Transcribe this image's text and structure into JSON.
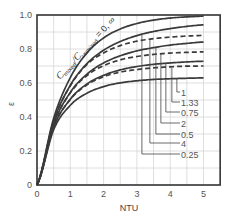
{
  "chart_data": {
    "type": "line",
    "title": "",
    "xlabel": "NTU",
    "ylabel": "ε",
    "xlim": [
      0,
      5.5
    ],
    "ylim": [
      0,
      1.0
    ],
    "grid": true,
    "grid_step_x": 0.5,
    "grid_step_y": 0.1,
    "x_ticks": [
      "0",
      "1",
      "2",
      "3",
      "4",
      "5"
    ],
    "y_ticks": [
      "0",
      "0.2",
      "0.4",
      "0.6",
      "0.8",
      "1.0"
    ],
    "annotation": {
      "prefix": "C",
      "sub1": "mixed",
      "slash": "/",
      "c2": "C",
      "sub2": "unmixed",
      "suffix": " = 0, ∞"
    },
    "x": [
      0,
      0.5,
      1,
      1.5,
      2,
      2.5,
      3,
      3.5,
      4,
      4.5,
      5
    ],
    "series": [
      {
        "name": "0, ∞",
        "style": "solid",
        "values": [
          0,
          0.393,
          0.632,
          0.777,
          0.865,
          0.918,
          0.95,
          0.97,
          0.982,
          0.989,
          0.993
        ]
      },
      {
        "name": "0.25",
        "style": "solid",
        "values": [
          0,
          0.375,
          0.587,
          0.714,
          0.793,
          0.844,
          0.879,
          0.903,
          0.92,
          0.933,
          0.942
        ]
      },
      {
        "name": "4",
        "style": "dashed",
        "values": [
          0,
          0.375,
          0.584,
          0.709,
          0.777,
          0.82,
          0.846,
          0.861,
          0.87,
          0.876,
          0.88
        ]
      },
      {
        "name": "0.5",
        "style": "solid",
        "values": [
          0,
          0.358,
          0.545,
          0.652,
          0.718,
          0.76,
          0.789,
          0.808,
          0.823,
          0.833,
          0.841
        ]
      },
      {
        "name": "2",
        "style": "dashed",
        "values": [
          0,
          0.357,
          0.542,
          0.644,
          0.702,
          0.736,
          0.756,
          0.768,
          0.776,
          0.78,
          0.783
        ]
      },
      {
        "name": "0.75",
        "style": "solid",
        "values": [
          0,
          0.341,
          0.505,
          0.594,
          0.645,
          0.677,
          0.697,
          0.71,
          0.718,
          0.724,
          0.728
        ]
      },
      {
        "name": "1.33",
        "style": "dashed",
        "values": [
          0,
          0.341,
          0.503,
          0.589,
          0.637,
          0.664,
          0.679,
          0.689,
          0.695,
          0.699,
          0.7
        ]
      },
      {
        "name": "1",
        "style": "solid",
        "values": [
          0,
          0.325,
          0.469,
          0.54,
          0.579,
          0.601,
          0.613,
          0.621,
          0.625,
          0.628,
          0.63
        ]
      }
    ],
    "legend": [
      {
        "label": "1",
        "series": "1",
        "leader_x": 4.2,
        "label_y_px": 92
      },
      {
        "label": "1.33",
        "series": "1.33",
        "leader_x": 4.05,
        "label_y_px": 102
      },
      {
        "label": "0.75",
        "series": "0.75",
        "leader_x": 3.87,
        "label_y_px": 112
      },
      {
        "label": "2",
        "series": "2",
        "leader_x": 3.72,
        "label_y_px": 123
      },
      {
        "label": "0.5",
        "series": "0.5",
        "leader_x": 3.57,
        "label_y_px": 134
      },
      {
        "label": "4",
        "series": "4",
        "leader_x": 3.39,
        "label_y_px": 143
      },
      {
        "label": "0.25",
        "series": "0.25",
        "leader_x": 3.15,
        "label_y_px": 154
      }
    ],
    "colors": {
      "curve": "#3a3a3a",
      "grid": "#d6d6d6",
      "frame": "#333333",
      "leader": "#444444"
    }
  }
}
